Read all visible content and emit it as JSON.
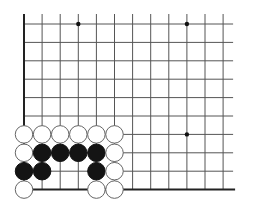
{
  "diagram": {
    "type": "go-board-corner",
    "grid": {
      "columns": 12,
      "rows": 10,
      "origin_x": 24,
      "origin_y": 24,
      "spacing_x": 18.1,
      "spacing_y": 18.4,
      "line_extend_right": 10,
      "line_extend_top": 10,
      "left_edge": true,
      "bottom_edge": true
    },
    "colors": {
      "line": "#555555",
      "edge": "#222222",
      "black_stone": "#141414",
      "white_stone_fill": "#ffffff",
      "white_stone_outline": "#666666"
    },
    "star_points": [
      {
        "col": 3,
        "row": 0
      },
      {
        "col": 9,
        "row": 0
      },
      {
        "col": 9,
        "row": 6
      }
    ],
    "stones": [
      {
        "color": "white",
        "col": 0,
        "row": 6
      },
      {
        "color": "white",
        "col": 1,
        "row": 6
      },
      {
        "color": "white",
        "col": 2,
        "row": 6
      },
      {
        "color": "white",
        "col": 3,
        "row": 6
      },
      {
        "color": "white",
        "col": 4,
        "row": 6
      },
      {
        "color": "white",
        "col": 5,
        "row": 6
      },
      {
        "color": "white",
        "col": 0,
        "row": 7
      },
      {
        "color": "black",
        "col": 1,
        "row": 7
      },
      {
        "color": "black",
        "col": 2,
        "row": 7
      },
      {
        "color": "black",
        "col": 3,
        "row": 7
      },
      {
        "color": "black",
        "col": 4,
        "row": 7
      },
      {
        "color": "white",
        "col": 5,
        "row": 7
      },
      {
        "color": "black",
        "col": 0,
        "row": 8
      },
      {
        "color": "black",
        "col": 1,
        "row": 8
      },
      {
        "color": "black",
        "col": 4,
        "row": 8
      },
      {
        "color": "white",
        "col": 5,
        "row": 8
      },
      {
        "color": "white",
        "col": 0,
        "row": 9
      },
      {
        "color": "white",
        "col": 4,
        "row": 9
      },
      {
        "color": "white",
        "col": 5,
        "row": 9
      }
    ]
  }
}
